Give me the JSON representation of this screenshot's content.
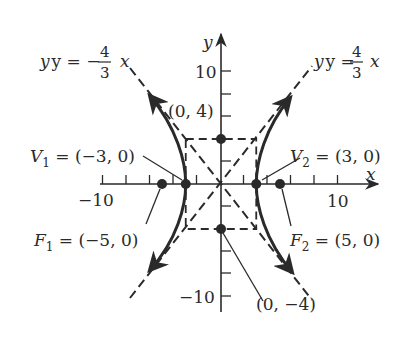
{
  "figure": {
    "type": "hyperbola",
    "equation_implied": "x^2/9 - y^2/16 = 1",
    "axes": {
      "x_label": "x",
      "y_label": "y",
      "x_ticks": {
        "step": 2,
        "labels": {
          "neg": "−10",
          "pos": "10"
        }
      },
      "y_ticks": {
        "step": 2,
        "labels": {
          "pos": "10",
          "neg": "−10"
        }
      }
    },
    "asymptotes": {
      "left": {
        "lhs": "y = −",
        "num": "4",
        "den": "3",
        "var": "x"
      },
      "right": {
        "lhs": "y = ",
        "num": "4",
        "den": "3",
        "var": "x"
      }
    },
    "points": {
      "v1": {
        "name": "V",
        "sub": "1",
        "value": " = (−3, 0)",
        "x": -3,
        "y": 0
      },
      "v2": {
        "name": "V",
        "sub": "2",
        "value": " = (3, 0)",
        "x": 3,
        "y": 0
      },
      "f1": {
        "name": "F",
        "sub": "1",
        "value": " = (−5, 0)",
        "x": -5,
        "y": 0
      },
      "f2": {
        "name": "F",
        "sub": "2",
        "value": " = (5, 0)",
        "x": 5,
        "y": 0
      },
      "b_top": {
        "label": "(0, 4)",
        "x": 0,
        "y": 4
      },
      "b_bottom": {
        "label": "(0, −4)",
        "x": 0,
        "y": -4
      }
    },
    "colors": {
      "ink": "#2a2a2a",
      "background": "#ffffff"
    }
  }
}
